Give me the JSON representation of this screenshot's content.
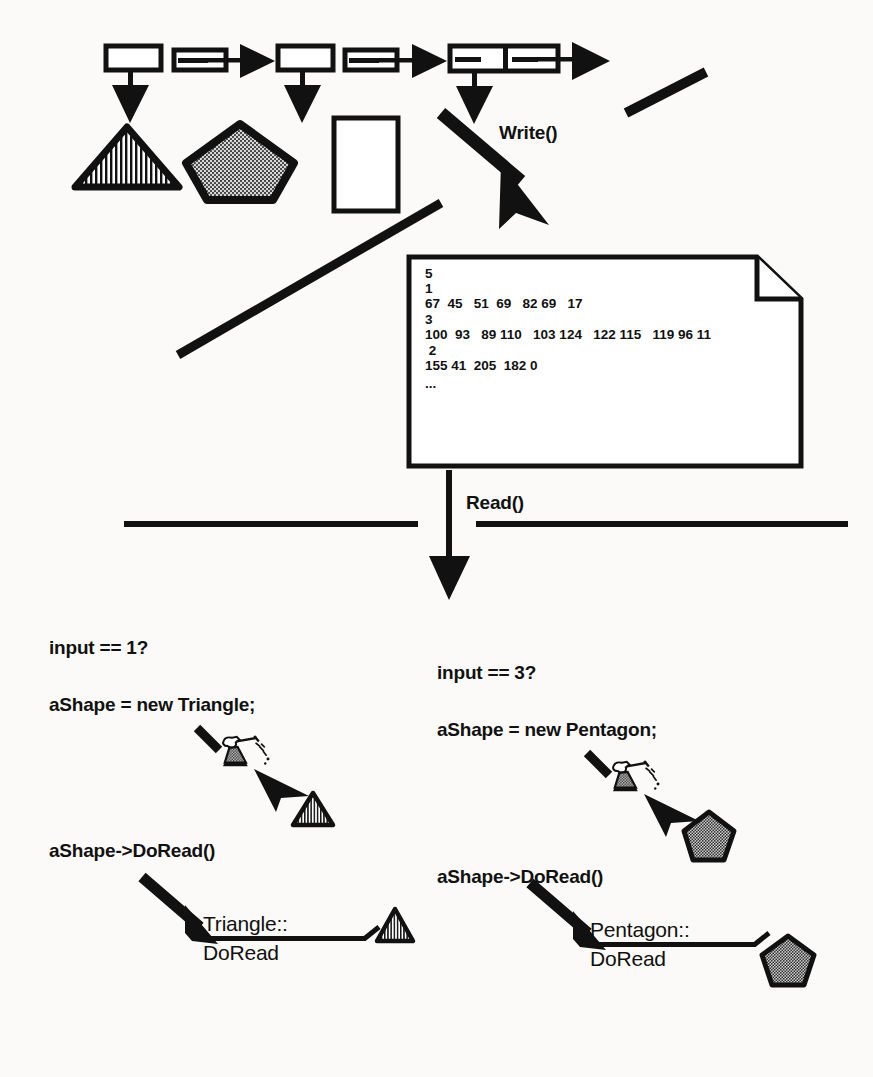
{
  "diagram": {
    "ink_color": "#111111",
    "background": "#fbfaf8"
  },
  "linked_list": {
    "name": "shape-list",
    "nodes": [
      {
        "id": "node-1",
        "label": ""
      },
      {
        "id": "node-2",
        "label": ""
      },
      {
        "id": "node-3",
        "label": ""
      }
    ]
  },
  "shapes": {
    "triangle": {
      "name": "triangle-shape",
      "fill": "vertical-hatch"
    },
    "pentagon": {
      "name": "pentagon-shape",
      "fill": "dotted"
    },
    "rectangle": {
      "name": "rectangle-shape",
      "fill": "none"
    }
  },
  "operations": {
    "write": "Write()",
    "read": "Read()"
  },
  "document_file": {
    "name": "serialized-data-file",
    "lines": [
      "5",
      "1",
      "67  45   51  69   82 69   17",
      "3",
      "100  93   89 110   103 124   122 115   119 96 11",
      " 2",
      "155 41  205  182 0",
      "..."
    ]
  },
  "branches": [
    {
      "id": "branch-triangle",
      "condition": "input == 1?",
      "allocation": "aShape = new Triangle;",
      "dispatch": "aShape->DoRead()",
      "method_line1": "Triangle::",
      "method_line2": "DoRead",
      "result_shape": "triangle"
    },
    {
      "id": "branch-pentagon",
      "condition": "input == 3?",
      "allocation": "aShape = new Pentagon;",
      "dispatch": "aShape->DoRead()",
      "method_line1": "Pentagon::",
      "method_line2": "DoRead",
      "result_shape": "pentagon"
    }
  ],
  "icons": {
    "magic_wand": "magic-wand-fairy-icon",
    "page_fold": "page-fold-corner-icon"
  }
}
